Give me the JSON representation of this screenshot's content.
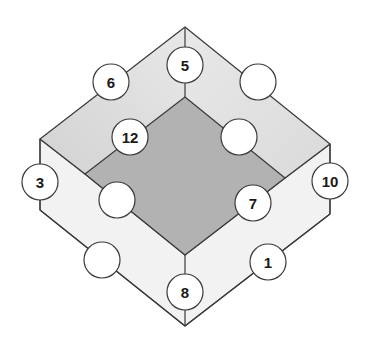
{
  "diagram": {
    "type": "isometric-frame-number-puzzle",
    "colors": {
      "inner_face": "#b2b2b2",
      "top_face_light": "#ececec",
      "top_face_dark": "#d6d6d6",
      "bottom_face": "#f2f2f2",
      "stroke": "#3a3a3a",
      "circle_fill": "#ffffff"
    },
    "nodes": [
      {
        "id": "outer-top-left",
        "label": "6",
        "cx": 111,
        "cy": 82
      },
      {
        "id": "top",
        "label": "5",
        "cx": 185,
        "cy": 65
      },
      {
        "id": "outer-top-right",
        "label": "",
        "cx": 258,
        "cy": 82
      },
      {
        "id": "inner-top-left",
        "label": "12",
        "cx": 130,
        "cy": 137
      },
      {
        "id": "inner-top-right",
        "label": "",
        "cx": 239,
        "cy": 137
      },
      {
        "id": "left",
        "label": "3",
        "cx": 40,
        "cy": 182
      },
      {
        "id": "right",
        "label": "10",
        "cx": 330,
        "cy": 181
      },
      {
        "id": "inner-bottom-left",
        "label": "",
        "cx": 117,
        "cy": 200
      },
      {
        "id": "inner-bottom-right",
        "label": "7",
        "cx": 253,
        "cy": 203
      },
      {
        "id": "outer-bottom-left",
        "label": "",
        "cx": 102,
        "cy": 260
      },
      {
        "id": "outer-bottom-right",
        "label": "1",
        "cx": 268,
        "cy": 262
      },
      {
        "id": "bottom",
        "label": "8",
        "cx": 185,
        "cy": 292
      }
    ]
  }
}
